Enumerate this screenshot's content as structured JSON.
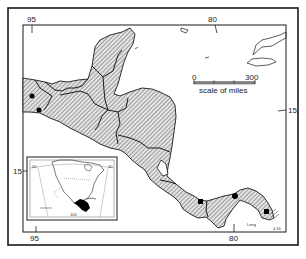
{
  "map": {
    "title": "",
    "graticule": {
      "top_labels": [
        "95",
        "80"
      ],
      "bottom_labels": [
        "95",
        "80"
      ],
      "left_labels": [
        "15"
      ],
      "right_labels": [
        "15"
      ]
    },
    "scale_bar": {
      "start_label": "0",
      "end_label": "300",
      "caption": "scale of miles"
    },
    "inset": {
      "description": "Locator map of North America with Central America highlighted in black",
      "edge_labels": [
        "40",
        "40",
        "100"
      ]
    },
    "credit": "Long",
    "plate_number": "4.16",
    "colors": {
      "frame": "#1a1a1a",
      "land_hatch": "#555555",
      "land_fill": "#d9d9d9",
      "border": "#1a1a1a",
      "locality_dot": "#000000",
      "background": "#ffffff"
    },
    "localities": [
      {
        "name": "locality-1",
        "x": 32,
        "y": 96
      },
      {
        "name": "locality-2",
        "x": 39,
        "y": 110
      },
      {
        "name": "locality-3",
        "x": 201,
        "y": 202
      },
      {
        "name": "locality-4",
        "x": 235,
        "y": 196
      },
      {
        "name": "locality-5",
        "x": 267,
        "y": 212
      }
    ]
  }
}
